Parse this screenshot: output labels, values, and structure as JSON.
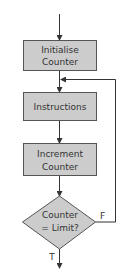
{
  "diagram": {
    "type": "flowchart",
    "colors": {
      "fill": "#cccccc",
      "stroke": "#555555",
      "line": "#333333",
      "text": "#333333"
    },
    "nodes": [
      {
        "id": "init",
        "shape": "rect",
        "line1": "Initialise",
        "line2": "Counter"
      },
      {
        "id": "instr",
        "shape": "rect",
        "line1": "Instructions"
      },
      {
        "id": "incr",
        "shape": "rect",
        "line1": "Increment",
        "line2": "Counter"
      },
      {
        "id": "decision",
        "shape": "diamond",
        "line1": "Counter",
        "line2": "= Limit?"
      }
    ],
    "edges": {
      "false_label": "F",
      "true_label": "T"
    }
  }
}
